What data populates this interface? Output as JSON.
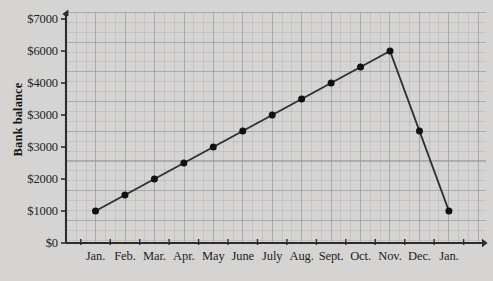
{
  "chart_data": {
    "type": "line",
    "title": "",
    "xlabel": "",
    "ylabel": "Bank balance",
    "categories": [
      "Jan.",
      "Feb.",
      "Mar.",
      "Apr.",
      "May",
      "June",
      "July",
      "Aug.",
      "Sept.",
      "Oct.",
      "Nov.",
      "Dec.",
      "Jan."
    ],
    "values": [
      1000,
      1500,
      2000,
      2500,
      3000,
      3500,
      4000,
      4500,
      5000,
      5500,
      6000,
      3500,
      1000
    ],
    "ylim": [
      0,
      7000
    ],
    "y_tick_labels": [
      "$7000",
      "$6000",
      "$4000",
      "$3000",
      "$3000",
      "$2000",
      "$1000",
      "$0"
    ],
    "y_tick_values": [
      7000,
      6000,
      5000,
      4000,
      3000,
      2000,
      1000,
      0
    ],
    "grid": true,
    "legend": "none",
    "marker": "filled-circle",
    "line_color": "#303030",
    "marker_color": "#111111",
    "background_color": "#d6d4d2",
    "grid_color": "#96969a"
  },
  "axes": {
    "y_title": "Bank balance",
    "x_ticks": [
      "Jan.",
      "Feb.",
      "Mar.",
      "Apr.",
      "May",
      "June",
      "July",
      "Aug.",
      "Sept.",
      "Oct.",
      "Nov.",
      "Dec.",
      "Jan."
    ],
    "y_ticks": [
      "$7000",
      "$6000",
      "$4000",
      "$3000",
      "$3000",
      "$2000",
      "$1000",
      "$0"
    ]
  }
}
